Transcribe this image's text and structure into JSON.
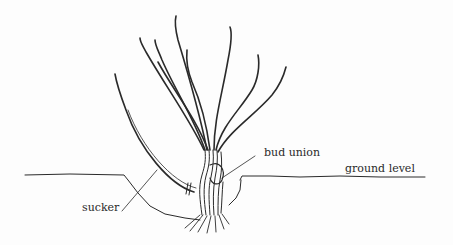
{
  "diagram": {
    "labels": {
      "bud_union": "bud union",
      "ground_level": "ground level",
      "sucker": "sucker"
    },
    "colors": {
      "ink": "#2a2a2a",
      "background": "#fdfdfd"
    }
  }
}
